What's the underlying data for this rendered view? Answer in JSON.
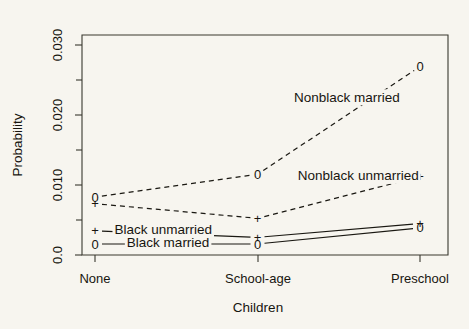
{
  "chart_data": {
    "type": "line",
    "title": "",
    "xlabel": "Children",
    "ylabel": "Probability",
    "categories": [
      "None",
      "School-age",
      "Preschool"
    ],
    "xtick_labels": [
      "None",
      "School-age",
      "Preschool"
    ],
    "ytick_labels": [
      "0.0",
      "0.010",
      "0.020",
      "0.030"
    ],
    "ytick_values": [
      0.0,
      0.01,
      0.02,
      0.03
    ],
    "ylim": [
      0.0,
      0.03
    ],
    "grid": false,
    "legend_position": "inline-annotations",
    "series": [
      {
        "name": "Nonblack married",
        "marker": "0",
        "linestyle": "dashed",
        "values": [
          0.0079,
          0.011,
          0.0257
        ],
        "label_text": "Nonblack married",
        "label_x_index": 1.55,
        "label_value": 0.0215
      },
      {
        "name": "Nonblack unmarried",
        "marker": "+",
        "linestyle": "dashed",
        "values": [
          0.007,
          0.005,
          0.0107
        ],
        "label_text": "Nonblack unmarried",
        "label_x_index": 1.62,
        "label_value": 0.0108
      },
      {
        "name": "Black unmarried",
        "marker": "+",
        "linestyle": "solid",
        "values": [
          0.0033,
          0.0024,
          0.0043
        ],
        "label_text": "Black unmarried",
        "label_x_index": 0.42,
        "label_value": 0.0035
      },
      {
        "name": "Black married",
        "marker": "0",
        "linestyle": "solid",
        "values": [
          0.0015,
          0.0015,
          0.0037
        ],
        "label_text": "Black married",
        "label_x_index": 0.45,
        "label_value": 0.0017
      }
    ]
  },
  "axes": {
    "y_title": "Probability",
    "x_title": "Children",
    "y_ticks": [
      "0.0",
      "0.010",
      "0.020",
      "0.030"
    ],
    "y_minor_count": 3,
    "x_ticks": [
      "None",
      "School-age",
      "Preschool"
    ]
  }
}
